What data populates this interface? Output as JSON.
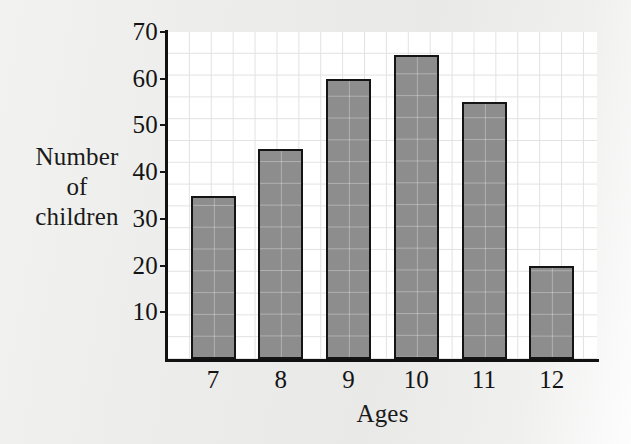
{
  "chart_data": {
    "type": "bar",
    "title": "",
    "xlabel": "Ages",
    "ylabel": "Number of children",
    "ylabel_lines": [
      "Number",
      "of",
      "children"
    ],
    "categories": [
      "7",
      "8",
      "9",
      "10",
      "11",
      "12"
    ],
    "values": [
      35,
      45,
      60,
      65,
      55,
      20
    ],
    "ylim": [
      0,
      70
    ],
    "ytick_labels": [
      "10",
      "20",
      "30",
      "40",
      "50",
      "60",
      "70"
    ],
    "ytick_values": [
      10,
      20,
      30,
      40,
      50,
      60,
      70
    ],
    "ytick_step": 10,
    "minor_gridline_step": 5,
    "grid": true,
    "legend": "none",
    "bar_color": "#8d8d8d",
    "bar_edge_color": "#141414",
    "axis_color": "#111111",
    "grid_color": "#e2e2e2",
    "plot_background": "#ffffff",
    "figure_background": "#ededeb"
  }
}
